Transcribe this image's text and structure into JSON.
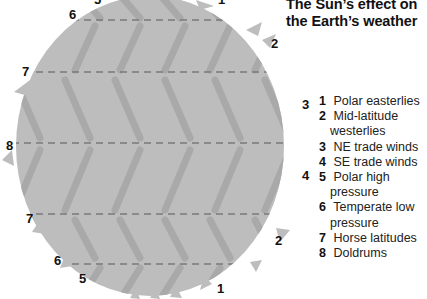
{
  "title": {
    "line1": "The Sun’s effect on",
    "line2": "the Earth’s weather"
  },
  "colors": {
    "globe_fill": "#bdbdbd",
    "arrow_streak": "#a8a8a8",
    "latitude_dash": "#7a7a7a",
    "text": "#111111"
  },
  "diagram_labels": [
    {
      "id": "top-5",
      "text": "5"
    },
    {
      "id": "top-1",
      "text": "1"
    },
    {
      "id": "top-6",
      "text": "6"
    },
    {
      "id": "top-2",
      "text": "2"
    },
    {
      "id": "upper-7",
      "text": "7"
    },
    {
      "id": "right-3",
      "text": "3"
    },
    {
      "id": "left-8",
      "text": "8"
    },
    {
      "id": "right-4",
      "text": "4"
    },
    {
      "id": "lower-7",
      "text": "7"
    },
    {
      "id": "bottom-2",
      "text": "2"
    },
    {
      "id": "bottom-6",
      "text": "6"
    },
    {
      "id": "bottom-5",
      "text": "5"
    },
    {
      "id": "bottom-1",
      "text": "1"
    }
  ],
  "legend": [
    {
      "number": "1",
      "label": "Polar easterlies"
    },
    {
      "number": "2",
      "label": "Mid-latitude westerlies"
    },
    {
      "number": "3",
      "label": "NE trade winds"
    },
    {
      "number": "4",
      "label": "SE trade winds"
    },
    {
      "number": "5",
      "label": "Polar high pressure"
    },
    {
      "number": "6",
      "label": "Temperate low pressure"
    },
    {
      "number": "7",
      "label": "Horse latitudes"
    },
    {
      "number": "8",
      "label": "Doldrums"
    }
  ]
}
